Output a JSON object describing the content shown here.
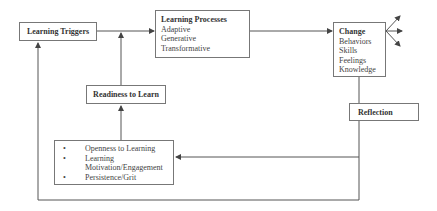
{
  "diagram": {
    "nodes": {
      "learning_triggers": {
        "title": "Learning Triggers"
      },
      "learning_processes": {
        "title": "Learning Processes",
        "items": [
          "Adaptive",
          "Generative",
          "Transformative"
        ]
      },
      "change": {
        "title": "Change",
        "items": [
          "Behaviors",
          "Skills",
          "Feelings",
          "Knowledge"
        ]
      },
      "readiness": {
        "title": "Readiness to Learn"
      },
      "reflection": {
        "title": "Reflection"
      },
      "readiness_factors": {
        "items": [
          "Openness to Learning",
          "Learning Motivation/Engagement",
          "Persistence/Grit"
        ]
      }
    },
    "edges": [
      {
        "from": "learning_triggers",
        "to": "learning_processes"
      },
      {
        "from": "readiness",
        "to": "learning_processes"
      },
      {
        "from": "learning_processes",
        "to": "change"
      },
      {
        "from": "readiness_factors",
        "to": "readiness"
      },
      {
        "from": "change",
        "to": "readiness_factors",
        "via": "reflection"
      },
      {
        "from": "change",
        "to": "learning_triggers"
      },
      {
        "from": "change",
        "to": "outputs",
        "count": 3
      }
    ]
  }
}
